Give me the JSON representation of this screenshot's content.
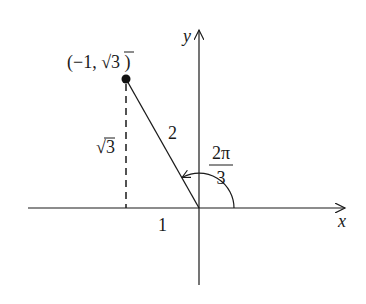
{
  "diagram": {
    "type": "unit-circle-angle",
    "axes": {
      "x_label": "x",
      "y_label": "y"
    },
    "point": {
      "label_open": "(−1, ",
      "label_sqrt": "√",
      "label_radicand": "3",
      "label_close": " )",
      "coordinates": [
        -1,
        "√3"
      ]
    },
    "segments": {
      "hypotenuse_label": "2",
      "vertical_label_sqrt": "√",
      "vertical_label_radicand": "3",
      "horizontal_label": "1"
    },
    "angle": {
      "numerator": "2π",
      "denominator": "3",
      "value": "2π/3"
    },
    "colors": {
      "ink": "#1a1a1a",
      "background": "#ffffff"
    }
  }
}
